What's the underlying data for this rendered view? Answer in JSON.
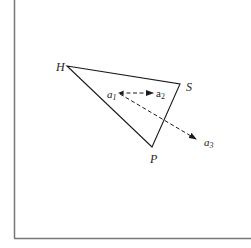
{
  "diagram": {
    "frame": {
      "left_x": 14,
      "bottom_y": 238,
      "color": "#777777"
    },
    "triangle": {
      "color": "#1a1a1a",
      "vertices": {
        "H": {
          "label": "H",
          "x": 67,
          "y": 66
        },
        "S": {
          "label": "S",
          "x": 180,
          "y": 84
        },
        "P": {
          "label": "P",
          "x": 152,
          "y": 147
        }
      }
    },
    "points": {
      "a1": {
        "label_main": "a",
        "label_sub": "1",
        "x": 118,
        "y": 93
      },
      "a2": {
        "label_main": "a",
        "label_sub": "2",
        "x": 153,
        "y": 93
      },
      "a3": {
        "label_main": "a",
        "label_sub": "3",
        "x": 196,
        "y": 139
      }
    },
    "arrows": [
      {
        "from": "a1",
        "to": "a2",
        "style": "dashed"
      },
      {
        "from": "a1",
        "to": "a3",
        "style": "dashed"
      }
    ]
  }
}
